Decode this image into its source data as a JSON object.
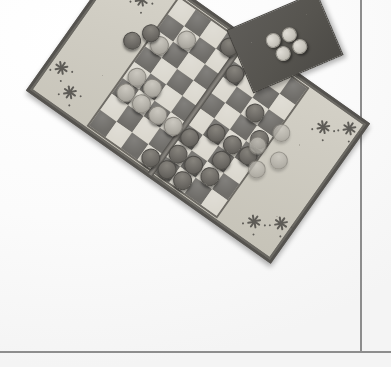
{
  "scene": {
    "title": "Folding checkers board with pieces",
    "description": "Overhead photo of a rotated folding draughts/checkers board on a white surface",
    "background_color": "#fdfdfd",
    "surface_line_color": "#8d8d8d"
  },
  "background": {
    "vertical_edge_label": "table-edge-vertical",
    "horizontal_edge_label": "table-edge-horizontal"
  },
  "board": {
    "label": "checkers-board",
    "rotation_degrees": 35.3,
    "frame_color": "#55534f",
    "tray_color": "#cfccc2",
    "hinge_label": "board-hinge",
    "playfield": {
      "label": "checkerboard-playfield",
      "rows": 8,
      "columns": 8,
      "light_square_color": "#dbd8cf",
      "dark_square_color": "#6f6d69"
    },
    "corner_decorations": [
      {
        "id": "burst-top-outer",
        "x": 16,
        "y": 13
      },
      {
        "id": "burst-top-inner",
        "x": 39,
        "y": 28
      },
      {
        "id": "burst-left-outer",
        "x": 13,
        "y": 130
      },
      {
        "id": "burst-left-inner",
        "x": 34,
        "y": 145
      },
      {
        "id": "burst-right-inner",
        "x": 261,
        "y": 27
      },
      {
        "id": "burst-right-outer",
        "x": 283,
        "y": 13
      },
      {
        "id": "burst-bottom-inner",
        "x": 259,
        "y": 144
      },
      {
        "id": "burst-bottom-outer",
        "x": 282,
        "y": 130
      }
    ]
  },
  "pieces": {
    "dark_color": "#706d68",
    "light_color": "#b4b1a9",
    "on_board": [
      {
        "color": "dark",
        "col": 3,
        "row": 0
      },
      {
        "color": "dark",
        "col": 4,
        "row": 1
      },
      {
        "color": "light",
        "col": 1,
        "row": 1
      },
      {
        "color": "light",
        "col": 0,
        "row": 2
      },
      {
        "color": "light",
        "col": 0,
        "row": 4
      },
      {
        "color": "light",
        "col": 1,
        "row": 4
      },
      {
        "color": "light",
        "col": 0,
        "row": 5
      },
      {
        "color": "light",
        "col": 1,
        "row": 5
      },
      {
        "color": "light",
        "col": 2,
        "row": 5
      },
      {
        "color": "light",
        "col": 3,
        "row": 5
      },
      {
        "color": "dark",
        "col": 6,
        "row": 2
      },
      {
        "color": "dark",
        "col": 5,
        "row": 4
      },
      {
        "color": "dark",
        "col": 6,
        "row": 4
      },
      {
        "color": "dark",
        "col": 7,
        "row": 4
      },
      {
        "color": "dark",
        "col": 7,
        "row": 3
      },
      {
        "color": "dark",
        "col": 4,
        "row": 5
      },
      {
        "color": "dark",
        "col": 6,
        "row": 5
      },
      {
        "color": "dark",
        "col": 4,
        "row": 6
      },
      {
        "color": "dark",
        "col": 5,
        "row": 6
      },
      {
        "color": "dark",
        "col": 6,
        "row": 6
      },
      {
        "color": "dark",
        "col": 3,
        "row": 7
      },
      {
        "color": "dark",
        "col": 4,
        "row": 7
      },
      {
        "color": "dark",
        "col": 5,
        "row": 7
      }
    ],
    "left_tray": [
      {
        "color": "dark",
        "x": 66,
        "y": 50
      },
      {
        "color": "dark",
        "x": 55,
        "y": 67
      }
    ],
    "right_tray": [
      {
        "color": "light",
        "x": 230,
        "y": 56
      },
      {
        "color": "light",
        "x": 218,
        "y": 80
      },
      {
        "color": "light",
        "x": 244,
        "y": 80
      },
      {
        "color": "light",
        "x": 231,
        "y": 100
      }
    ],
    "on_card": [
      {
        "color": "light",
        "x": 38,
        "y": 27
      },
      {
        "color": "light",
        "x": 55,
        "y": 28
      },
      {
        "color": "light",
        "x": 42,
        "y": 43
      },
      {
        "color": "light",
        "x": 60,
        "y": 43
      }
    ]
  },
  "card": {
    "label": "piece-storage-card",
    "rotation_degrees": -23,
    "color": "#56544f",
    "piece_count": 4
  }
}
